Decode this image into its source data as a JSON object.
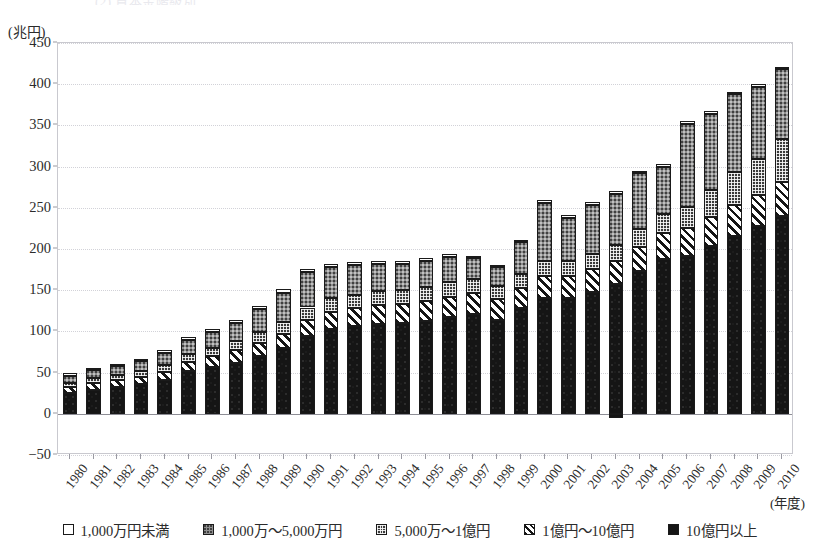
{
  "cropped_title_remnant": "(2)  資本金階級別",
  "unit_label": "(兆円)",
  "x_axis_title": "(年度)",
  "colors": {
    "axis": "#2b2b2b",
    "grid": "#d2d2d8",
    "frame": "#c9c9cf",
    "series_white": "#ffffff",
    "series_gray": "#8e8e8e",
    "series_check": "#3a3a3a",
    "series_hatch": "#ffffff",
    "series_black": "#151515"
  },
  "legend": {
    "items": [
      {
        "label": "1,000万円未満",
        "pattern": "s-white",
        "icon": "legend-swatch-open-square"
      },
      {
        "label": "1,000万～5,000万円",
        "pattern": "s-gray",
        "icon": "legend-swatch-gray-dotted"
      },
      {
        "label": "5,000万～1億円",
        "pattern": "s-check",
        "icon": "legend-swatch-checkered"
      },
      {
        "label": "1億円～10億円",
        "pattern": "s-hatch",
        "icon": "legend-swatch-diagonal-hatch"
      },
      {
        "label": "10億円以上",
        "pattern": "s-black",
        "icon": "legend-swatch-solid-black"
      }
    ]
  },
  "chart_data": {
    "type": "bar",
    "subtype": "stacked-vertical",
    "title": "",
    "xlabel": "(年度)",
    "ylabel": "(兆円)",
    "ylim": [
      -50,
      450
    ],
    "ytick_labels": [
      "450",
      "400",
      "350",
      "300",
      "250",
      "200",
      "150",
      "100",
      "50",
      "0",
      "−50"
    ],
    "ytick_values": [
      450,
      400,
      350,
      300,
      250,
      200,
      150,
      100,
      50,
      0,
      -50
    ],
    "ytick_step": 50,
    "grid": true,
    "grid_axis": "y",
    "legend_position": "bottom",
    "stack_order_bottom_to_top": [
      "10億円以上",
      "1億円～10億円",
      "5,000万～1億円",
      "1,000万～5,000万円",
      "1,000万円未満"
    ],
    "categories": [
      "1980",
      "1981",
      "1982",
      "1983",
      "1984",
      "1985",
      "1986",
      "1987",
      "1988",
      "1989",
      "1990",
      "1991",
      "1992",
      "1993",
      "1994",
      "1995",
      "1996",
      "1997",
      "1998",
      "1999",
      "2000",
      "2001",
      "2002",
      "2003",
      "2004",
      "2005",
      "2006",
      "2007",
      "2008",
      "2009",
      "2010"
    ],
    "series": [
      {
        "name": "10億円以上",
        "pattern": "s-black",
        "values": [
          25,
          29,
          33,
          36,
          41,
          52,
          57,
          62,
          70,
          80,
          95,
          103,
          106,
          109,
          110,
          113,
          118,
          121,
          114,
          128,
          141,
          140,
          148,
          157,
          173,
          188,
          192,
          204,
          216,
          228,
          240
        ]
      },
      {
        "name": "1億円～10億円",
        "pattern": "s-hatch",
        "values": [
          7,
          8,
          8,
          9,
          10,
          11,
          13,
          15,
          16,
          17,
          19,
          21,
          22,
          23,
          23,
          24,
          24,
          25,
          25,
          25,
          26,
          27,
          28,
          29,
          30,
          31,
          33,
          35,
          37,
          38,
          41
        ]
      },
      {
        "name": "5,000万～1億円",
        "pattern": "s-check",
        "values": [
          5,
          6,
          6,
          7,
          8,
          9,
          10,
          11,
          13,
          14,
          15,
          16,
          16,
          17,
          17,
          17,
          18,
          17,
          16,
          17,
          18,
          18,
          18,
          19,
          21,
          23,
          26,
          32,
          40,
          43,
          53
        ]
      },
      {
        "name": "1,000万～5,000万円",
        "pattern": "s-gray",
        "values": [
          9,
          10,
          11,
          12,
          15,
          17,
          19,
          22,
          28,
          36,
          43,
          38,
          36,
          33,
          32,
          31,
          30,
          26,
          23,
          38,
          71,
          53,
          60,
          62,
          68,
          58,
          101,
          93,
          95,
          88,
          84
        ]
      },
      {
        "name": "1,000万円未満",
        "pattern": "s-white",
        "values": [
          3,
          3,
          3,
          3,
          4,
          4,
          4,
          4,
          4,
          4,
          4,
          4,
          4,
          4,
          4,
          4,
          4,
          3,
          3,
          3,
          3,
          3,
          3,
          3,
          3,
          3,
          3,
          3,
          3,
          3,
          3
        ]
      },
      {
        "name": "負値（0未満部分）",
        "pattern": "s-black",
        "negative": true,
        "values": [
          0,
          0,
          0,
          0,
          0,
          0,
          0,
          0,
          0,
          0,
          0,
          0,
          0,
          0,
          0,
          0,
          0,
          0,
          0,
          0,
          0,
          0,
          0,
          -5,
          0,
          0,
          0,
          0,
          0,
          0,
          0
        ]
      }
    ],
    "totals": [
      49,
      56,
      61,
      67,
      78,
      93,
      103,
      114,
      131,
      151,
      176,
      182,
      184,
      186,
      186,
      189,
      194,
      192,
      181,
      211,
      259,
      241,
      257,
      270,
      295,
      303,
      355,
      367,
      391,
      400,
      421
    ]
  }
}
